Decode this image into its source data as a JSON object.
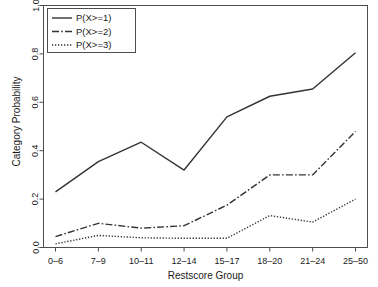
{
  "chart_data": {
    "type": "line",
    "title": "",
    "xlabel": "Restscore Group",
    "ylabel": "Category Probability",
    "categories": [
      "0–6",
      "7–9",
      "10–11",
      "12–14",
      "15–17",
      "18–20",
      "21–24",
      "25–50"
    ],
    "xtick_labels": [
      "0–6",
      "7–9",
      "10–11",
      "12–14",
      "15–17",
      "18–20",
      "21–24",
      "25–50"
    ],
    "ytick_labels": [
      "0.0",
      "0.2",
      "0.4",
      "0.6",
      "0.8",
      "1.0"
    ],
    "ytick_values": [
      0.0,
      0.2,
      0.4,
      0.6,
      0.8,
      1.0
    ],
    "ylim": [
      0.0,
      1.0
    ],
    "grid": false,
    "legend_position": "top-left",
    "series": [
      {
        "name": "P(X>=1)",
        "style": "solid",
        "color": "#333333",
        "values": [
          0.23,
          0.355,
          0.435,
          0.32,
          0.54,
          0.625,
          0.655,
          0.805
        ]
      },
      {
        "name": "P(X>=2)",
        "style": "dashdot",
        "color": "#333333",
        "values": [
          0.045,
          0.1,
          0.08,
          0.09,
          0.175,
          0.3,
          0.3,
          0.48
        ]
      },
      {
        "name": "P(X>=3)",
        "style": "dotted",
        "color": "#333333",
        "values": [
          0.015,
          0.05,
          0.04,
          0.038,
          0.038,
          0.132,
          0.105,
          0.2
        ]
      }
    ]
  },
  "legend": {
    "entries": [
      {
        "label": "P(X>=1)"
      },
      {
        "label": "P(X>=2)"
      },
      {
        "label": "P(X>=3)"
      }
    ]
  },
  "axes": {
    "x_title": "Restscore Group",
    "y_title": "Category Probability"
  }
}
